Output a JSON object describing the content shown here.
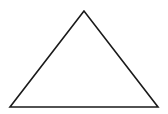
{
  "diagram": {
    "shape": "triangle",
    "style": "outline",
    "stroke_color": "#1a1a1a",
    "fill_color": "none",
    "stroke_width": 1.6,
    "vertices": [
      {
        "name": "apex",
        "x": 84,
        "y": 11
      },
      {
        "name": "bottom-left",
        "x": 10,
        "y": 107
      },
      {
        "name": "bottom-right",
        "x": 158,
        "y": 107
      }
    ]
  }
}
